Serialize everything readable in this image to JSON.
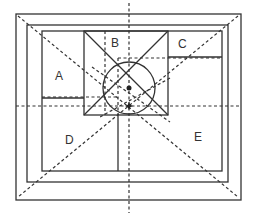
{
  "diagram": {
    "type": "nested-frame layout with diagonal guides",
    "regions": [
      {
        "id": "A",
        "label": "A",
        "x": 67,
        "y": 77
      },
      {
        "id": "B",
        "label": "B",
        "x": 116,
        "y": 20
      },
      {
        "id": "C",
        "label": "C",
        "x": 184,
        "y": 47
      },
      {
        "id": "D",
        "label": "D",
        "x": 70,
        "y": 140
      },
      {
        "id": "E",
        "label": "E",
        "x": 199,
        "y": 137
      }
    ],
    "markers": [
      {
        "name": "upper-dot",
        "shape": "dot"
      },
      {
        "name": "lower-star",
        "shape": "star"
      }
    ],
    "colors": {
      "line": "#333333",
      "background": "#ffffff"
    }
  }
}
